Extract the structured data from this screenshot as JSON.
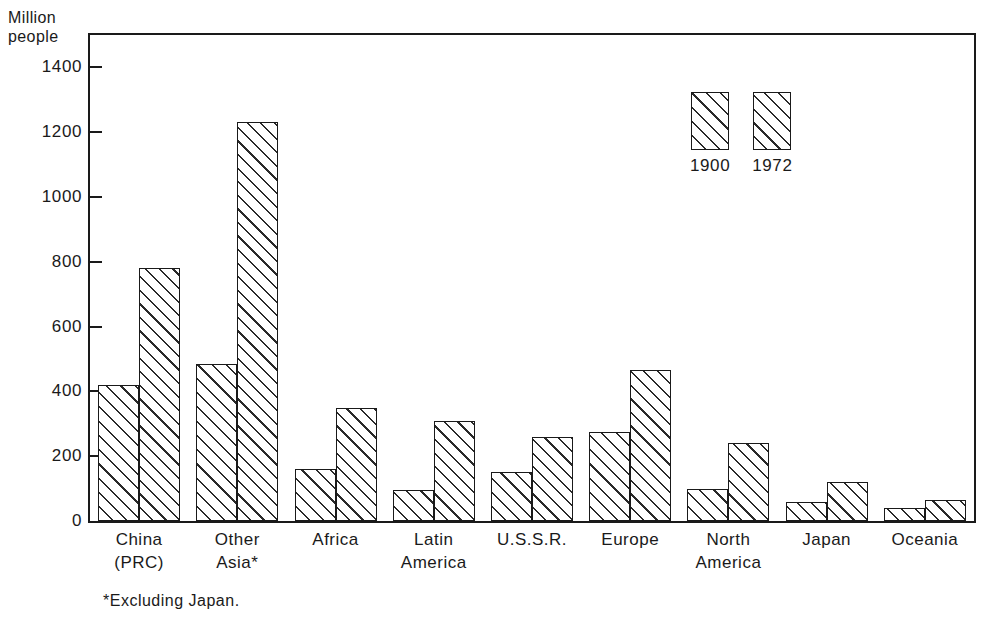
{
  "chart_data": {
    "type": "bar",
    "title": "",
    "xlabel": "",
    "ylabel": "Million\npeople",
    "ylim": [
      0,
      1500
    ],
    "yticks": [
      0,
      200,
      400,
      600,
      800,
      1000,
      1200,
      1400
    ],
    "ytick_labels": [
      "0",
      "200",
      "400",
      "600",
      "800",
      "1000",
      "1200",
      "1400"
    ],
    "grid": false,
    "legend_position": "inside-top-right",
    "categories": [
      "China\n(PRC)",
      "Other\nAsia*",
      "Africa",
      "Latin\nAmerica",
      "U.S.S.R.",
      "Europe",
      "North\nAmerica",
      "Japan",
      "Oceania"
    ],
    "series": [
      {
        "name": "1900",
        "values": [
          420,
          485,
          160,
          95,
          150,
          275,
          100,
          60,
          40
        ]
      },
      {
        "name": "1972",
        "values": [
          780,
          1230,
          350,
          310,
          260,
          465,
          240,
          120,
          65
        ]
      }
    ],
    "footnote": "*Excluding Japan."
  },
  "legend": {
    "items": [
      {
        "label": "1900",
        "swatch": "diagonal-hatch-wide"
      },
      {
        "label": "1972",
        "swatch": "diagonal-hatch-narrow"
      }
    ]
  },
  "colors": {
    "ink": "#1a1a1a",
    "hatch": "#2a2a2a",
    "background": "#ffffff"
  }
}
